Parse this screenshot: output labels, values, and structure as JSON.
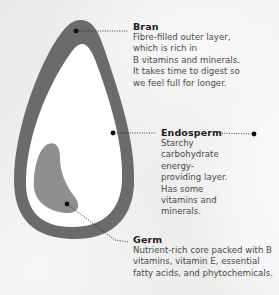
{
  "diagram": {
    "colors": {
      "background": "#ececec",
      "bran": "#6b6b6b",
      "endosperm": "#ffffff",
      "germ": "#8f8f8f",
      "leader": "#2a2a2a",
      "title_text": "#1e1e1e",
      "body_text": "#4a4a4a"
    },
    "parts": [
      {
        "id": "bran",
        "title": "Bran",
        "description": "Fibre-filled outer layer, which is rich in B vitamins and minerals. It takes time to digest so we feel full for longer.",
        "lines": [
          "Fibre-filled outer layer,",
          "which is rich in",
          "B vitamins and minerals.",
          "It takes time to digest so",
          "we feel full for longer."
        ]
      },
      {
        "id": "endosperm",
        "title": "Endosperm",
        "description": "Starchy carbohydrate energy-providing layer. Has some vitamins and minerals.",
        "lines": [
          "Starchy",
          "carbohydrate",
          "energy-",
          "providing layer.",
          "Has some",
          "vitamins and",
          "minerals."
        ]
      },
      {
        "id": "germ",
        "title": "Germ",
        "description": "Nutrient-rich core packed with B vitamins, vitamin E, essential fatty acids, and phytochemicals.",
        "lines": [
          "Nutrient-rich core packed with B",
          "vitamins, vitamin E, essential",
          "fatty acids, and phytochemicals."
        ]
      }
    ]
  }
}
